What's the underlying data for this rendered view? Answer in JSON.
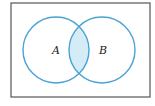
{
  "diagram": {
    "type": "venn",
    "universe": {
      "x": 11,
      "y": 3,
      "width": 139,
      "height": 94,
      "stroke": "#555555"
    },
    "sets": [
      {
        "id": "A",
        "label": "A",
        "cx": 56,
        "cy": 50,
        "r": 33,
        "label_x": 55,
        "label_y": 54
      },
      {
        "id": "B",
        "label": "B",
        "cx": 102,
        "cy": 50,
        "r": 33,
        "label_x": 103,
        "label_y": 54
      }
    ],
    "intersection": {
      "shaded": true,
      "fill": "#d4ecf5"
    },
    "colors": {
      "circle_stroke": "#4aa3d3",
      "shade": "#d4ecf5"
    }
  }
}
